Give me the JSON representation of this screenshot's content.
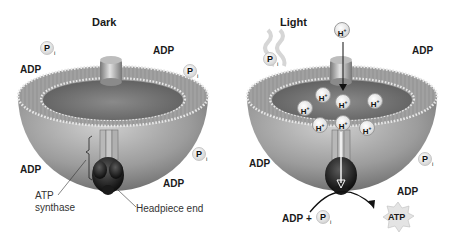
{
  "panels": [
    {
      "title": "Dark",
      "labels": {
        "adp_1": "ADP",
        "adp_2": "ADP",
        "adp_3": "ADP",
        "adp_4": "ADP",
        "pi_symbol": "P",
        "pi_subscript": "i",
        "atp_synthase": "ATP\nsynthase",
        "atp_synthase_line1": "ATP",
        "atp_synthase_line2": "synthase",
        "headpiece": "Headpiece end"
      }
    },
    {
      "title": "Light",
      "labels": {
        "h_plus": "H",
        "h_plus_sup": "+",
        "adp_1": "ADP",
        "adp_2": "ADP",
        "adp_3": "ADP",
        "pi_symbol": "P",
        "pi_subscript": "i",
        "reaction_adp": "ADP",
        "reaction_plus": "+",
        "product": "ATP"
      }
    }
  ],
  "colors": {
    "membrane": "#9a9a9a",
    "lumen": "#7a7a7a",
    "synthase": "#2a2a2a",
    "channel": "#a0a0a0",
    "background": "#ffffff"
  }
}
